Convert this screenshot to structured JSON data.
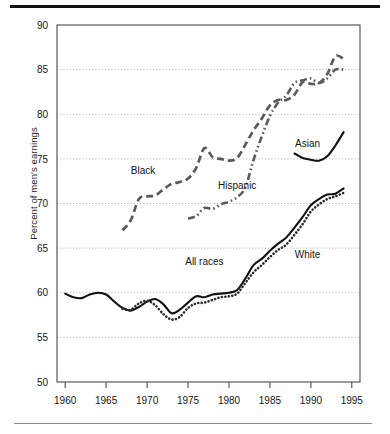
{
  "figure": {
    "ylabel": "Percent of men's earnings",
    "rule_color": "#111111",
    "grid_color": "#9a9a9a",
    "axis_color": "#4a4a4a",
    "series_color": "#4a4a4a",
    "solid_color": "#111111"
  },
  "chart_data": {
    "type": "line",
    "title": "",
    "xlabel": "",
    "ylabel": "Percent of men's earnings",
    "xlim": [
      1959,
      1996
    ],
    "ylim": [
      50,
      90
    ],
    "xticks": [
      1960,
      1965,
      1970,
      1975,
      1980,
      1985,
      1990,
      1995
    ],
    "xtick_labels": [
      "1960",
      "1965",
      "1970",
      "1975",
      "1980",
      "1985",
      "1990",
      "1995"
    ],
    "yticks": [
      50,
      55,
      60,
      65,
      70,
      75,
      80,
      85,
      90
    ],
    "ytick_labels": [
      "50",
      "55",
      "60",
      "65",
      "70",
      "75",
      "80",
      "85",
      "90"
    ],
    "grid": "horizontal-dotted",
    "legend": "inline-labels",
    "series": [
      {
        "name": "All races",
        "style": "solid",
        "label_x": 1977.0,
        "label_y": 63.1,
        "x": [
          1960,
          1961,
          1962,
          1963,
          1964,
          1965,
          1966,
          1967,
          1968,
          1969,
          1970,
          1971,
          1972,
          1973,
          1974,
          1975,
          1976,
          1977,
          1978,
          1979,
          1980,
          1981,
          1982,
          1983,
          1984,
          1985,
          1986,
          1987,
          1988,
          1989,
          1990,
          1991,
          1992,
          1993,
          1994
        ],
        "values": [
          59.9,
          59.5,
          59.4,
          59.8,
          60.0,
          59.8,
          59.0,
          58.3,
          58.0,
          58.4,
          59.0,
          59.3,
          58.7,
          57.7,
          58.1,
          58.9,
          59.6,
          59.5,
          59.8,
          59.9,
          60.0,
          60.3,
          61.6,
          63.1,
          63.8,
          64.7,
          65.5,
          66.2,
          67.3,
          68.5,
          69.8,
          70.5,
          71.0,
          71.1,
          71.7
        ]
      },
      {
        "name": "White",
        "style": "dotted",
        "label_x": 1989.6,
        "label_y": 63.9,
        "x": [
          1967,
          1968,
          1969,
          1970,
          1971,
          1972,
          1973,
          1974,
          1975,
          1976,
          1977,
          1978,
          1979,
          1980,
          1981,
          1982,
          1983,
          1984,
          1985,
          1986,
          1987,
          1988,
          1989,
          1990,
          1991,
          1992,
          1993,
          1994
        ],
        "values": [
          58.2,
          58.1,
          58.8,
          59.1,
          58.6,
          57.6,
          57.0,
          57.3,
          58.3,
          58.8,
          58.9,
          59.2,
          59.5,
          59.6,
          59.9,
          61.1,
          62.3,
          63.1,
          64.0,
          64.8,
          65.4,
          66.5,
          67.7,
          69.1,
          69.9,
          70.5,
          70.8,
          71.2
        ]
      },
      {
        "name": "Black",
        "style": "dashed",
        "label_x": 1969.5,
        "label_y": 73.3,
        "x": [
          1967,
          1968,
          1969,
          1970,
          1971,
          1972,
          1973,
          1974,
          1975,
          1976,
          1977,
          1978,
          1979,
          1980,
          1981,
          1982,
          1983,
          1984,
          1985,
          1986,
          1987,
          1988,
          1989,
          1990,
          1991,
          1992,
          1993,
          1994
        ],
        "values": [
          67.0,
          68.1,
          70.5,
          70.8,
          70.9,
          71.6,
          72.2,
          72.4,
          72.8,
          74.0,
          76.2,
          75.2,
          75.0,
          74.8,
          75.1,
          76.6,
          78.2,
          79.5,
          81.0,
          81.6,
          81.6,
          82.2,
          83.6,
          83.4,
          83.5,
          84.5,
          86.5,
          86.2
        ]
      },
      {
        "name": "Hispanic",
        "style": "dashdotdot",
        "label_x": 1981.0,
        "label_y": 71.6,
        "x": [
          1975,
          1976,
          1977,
          1978,
          1979,
          1980,
          1981,
          1982,
          1983,
          1984,
          1985,
          1986,
          1987,
          1988,
          1989,
          1990,
          1991,
          1992,
          1993,
          1994
        ],
        "values": [
          68.3,
          68.6,
          69.5,
          69.4,
          69.9,
          70.2,
          70.7,
          71.8,
          74.9,
          77.5,
          79.8,
          81.3,
          82.1,
          83.5,
          83.8,
          84.0,
          83.5,
          84.0,
          85.0,
          85.0
        ]
      },
      {
        "name": "Asian",
        "style": "solid-short",
        "label_x": 1989.6,
        "label_y": 76.3,
        "x": [
          1988,
          1989,
          1990,
          1991,
          1992,
          1993,
          1994
        ],
        "values": [
          75.6,
          75.1,
          74.9,
          74.8,
          75.3,
          76.5,
          78.0
        ]
      }
    ]
  }
}
